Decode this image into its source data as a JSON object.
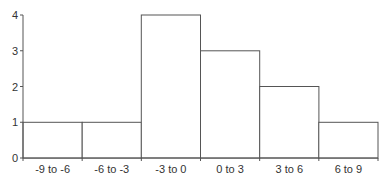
{
  "chart_data": {
    "type": "bar",
    "title": "",
    "xlabel": "",
    "ylabel": "",
    "categories": [
      "-9 to -6",
      "-6 to -3",
      "-3 to 0",
      "0 to 3",
      "3 to 6",
      "6 to 9"
    ],
    "values": [
      1,
      1,
      4,
      3,
      2,
      1
    ],
    "ylim": [
      0,
      4
    ],
    "yticks": [
      0,
      1,
      2,
      3,
      4
    ],
    "grid": false,
    "legend": null,
    "bar_style": "histogram, white fill, dark outline, no gaps"
  },
  "colors": {
    "bar_fill": "#ffffff",
    "bar_stroke": "#555555",
    "axis": "#555555"
  }
}
